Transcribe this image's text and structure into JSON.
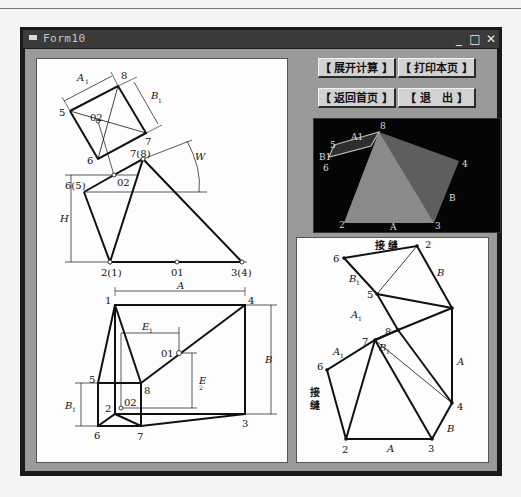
{
  "window": {
    "title": "Form10",
    "controls": {
      "minimize": "_",
      "maximize": "□",
      "close": "✕"
    }
  },
  "buttons": {
    "unfold_calc": "【 展开计算 】",
    "print_page": "【 打印本页 】",
    "back_home": "【 返回首页 】",
    "exit": "【 退　出 】"
  },
  "preview3d": {
    "labels": {
      "p8": "8",
      "a1": "A1",
      "p5": "5",
      "b1": "B1",
      "p6": "6",
      "p4": "4",
      "b": "B",
      "p2": "2",
      "a": "A",
      "p3": "3"
    },
    "colors": {
      "background": "#050505",
      "face_front": "#8a8a8a",
      "face_side": "#5e5e5e",
      "face_top": "#3a3a3a"
    }
  },
  "left_drawing": {
    "top_view": {
      "a1": "A",
      "a1_sub": "1",
      "b1": "B",
      "b1_sub": "1",
      "p8": "8",
      "p5": "5",
      "p6": "6",
      "p7": "7",
      "o2": "02"
    },
    "front_view": {
      "p78": "7(8)",
      "p65": "6(5)",
      "o2": "02",
      "h": "H",
      "w": "W",
      "p21": "2(1)",
      "o1": "01",
      "p34": "3(4)"
    },
    "plan_view": {
      "a": "A",
      "b": "B",
      "p1": "1",
      "p4": "4",
      "e1": "E",
      "e1_sub": "1",
      "e2": "E",
      "e2_sub": "2",
      "o1": "01",
      "p5": "5",
      "p8": "8",
      "b1": "B",
      "b1_sub": "1",
      "p2": "2",
      "o2": "02",
      "p3": "3",
      "p6": "6",
      "p7": "7"
    }
  },
  "right_drawing": {
    "seam_top": "接 缝",
    "seam_left_1": "接",
    "seam_left_2": "缝",
    "p2top": "2",
    "p6top": "6",
    "b1top": "B",
    "b1top_sub": "1",
    "b": "B",
    "p5": "5",
    "a1top": "A",
    "a1top_sub": "1",
    "p8": "8",
    "b1mid": "B",
    "b1mid_sub": "1",
    "p7": "7",
    "a1mid": "A",
    "a1mid_sub": "1",
    "a_right": "A",
    "p6": "6",
    "p4": "4",
    "b_bottom": "B",
    "p2": "2",
    "a_bottom": "A",
    "p3": "3"
  }
}
